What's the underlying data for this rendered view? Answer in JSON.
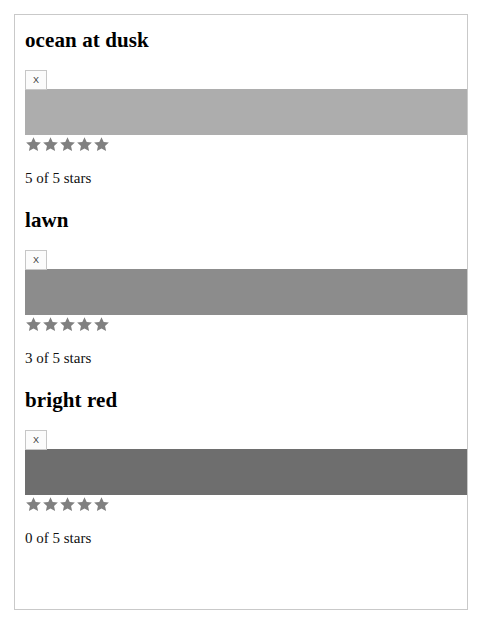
{
  "page": {
    "background_color": "#ffffff",
    "card_border_color": "#c9c9c9"
  },
  "swatches": [
    {
      "title": "ocean at dusk",
      "image_alt": "X",
      "color_hex": "#adadad",
      "stars_filled": 5,
      "stars_total": 5,
      "star_color": "#808080",
      "rating_text": "5 of 5 stars"
    },
    {
      "title": "lawn",
      "image_alt": "X",
      "color_hex": "#8c8c8c",
      "stars_filled": 5,
      "stars_total": 5,
      "star_color": "#808080",
      "rating_text": "3 of 5 stars"
    },
    {
      "title": "bright red",
      "image_alt": "X",
      "color_hex": "#6e6e6e",
      "stars_filled": 5,
      "stars_total": 5,
      "star_color": "#808080",
      "rating_text": "0 of 5 stars"
    }
  ],
  "footer": {
    "note": ""
  }
}
